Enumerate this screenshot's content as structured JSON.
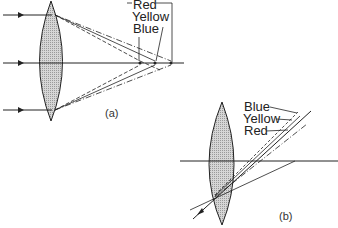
{
  "figure_a": {
    "caption": "(a)",
    "labels": {
      "red": "Red",
      "yellow": "Yellow",
      "blue": "Blue"
    }
  },
  "figure_b": {
    "caption": "(b)",
    "labels": {
      "blue": "Blue",
      "yellow": "Yellow",
      "red": "Red"
    }
  },
  "colors": {
    "lens_fill": "#c8c8c8",
    "stroke": "#222222"
  }
}
